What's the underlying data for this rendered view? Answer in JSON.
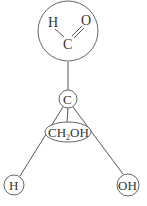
{
  "diagram": {
    "type": "molecular-structure",
    "aldehyde_group": {
      "atoms": [
        "H",
        "C",
        "O"
      ],
      "bond": "C=O double bond"
    },
    "chiral_center": {
      "label": "C"
    },
    "substituents": {
      "back": {
        "label_main": "CH",
        "label_sub": "2",
        "label_tail": "OH"
      },
      "left": {
        "label": "H"
      },
      "right": {
        "label": "OH"
      }
    },
    "colors": {
      "stroke": "#666666",
      "text": "#333333",
      "background": "#ffffff"
    }
  }
}
